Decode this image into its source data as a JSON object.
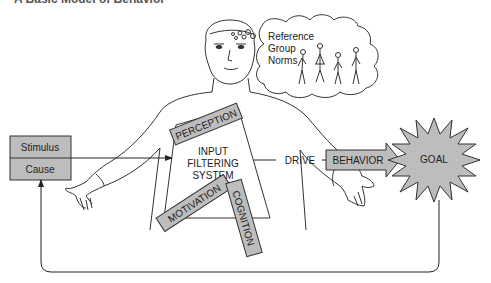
{
  "title": "A Basic Model of Behavior",
  "thought_bubble": {
    "lines": [
      "Reference",
      "Group",
      "Norms"
    ]
  },
  "stimulus_box": {
    "top": "Stimulus",
    "bottom": "Cause"
  },
  "center": {
    "lines": [
      "INPUT",
      "FILTERING",
      "SYSTEM"
    ]
  },
  "filters": {
    "perception": "PERCEPTION",
    "motivation": "MOTIVATION",
    "cognition": "COGNITION"
  },
  "drive": "DRIVE",
  "behavior": "BEHAVIOR",
  "goal": "GOAL",
  "colors": {
    "box_fill": "#bdbdbd",
    "line": "#222222"
  }
}
